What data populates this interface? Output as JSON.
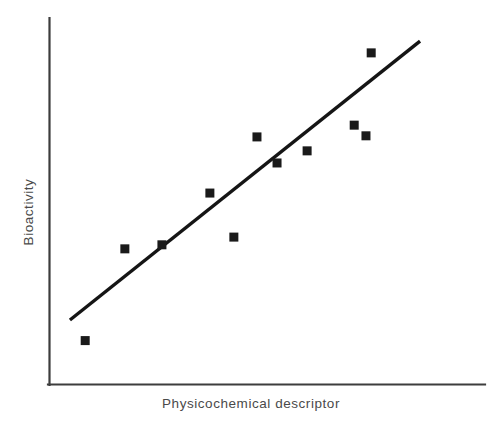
{
  "chart_data": {
    "type": "scatter",
    "title": "",
    "xlabel": "Physicochemical descriptor",
    "ylabel": "Bioactivity",
    "grid": false,
    "legend": false,
    "axis_ticks": false,
    "xlim": [
      0,
      100
    ],
    "ylim": [
      0,
      100
    ],
    "marker_style": "filled-square",
    "marker_color": "#1a1a1a",
    "axis_color": "#3d3d3d",
    "trend_line_color": "#151515",
    "background_color": "#ffffff",
    "points": [
      {
        "id": "p1",
        "x": 8.3,
        "y": 12.1
      },
      {
        "id": "p2",
        "x": 17.4,
        "y": 37.1
      },
      {
        "id": "p3",
        "x": 25.9,
        "y": 38.2
      },
      {
        "id": "p4",
        "x": 36.9,
        "y": 52.3
      },
      {
        "id": "p5",
        "x": 42.4,
        "y": 40.3
      },
      {
        "id": "p6",
        "x": 47.7,
        "y": 67.6
      },
      {
        "id": "p7",
        "x": 52.3,
        "y": 60.5
      },
      {
        "id": "p8",
        "x": 59.2,
        "y": 63.8
      },
      {
        "id": "p9",
        "x": 70.0,
        "y": 70.8
      },
      {
        "id": "p10",
        "x": 72.7,
        "y": 67.9
      },
      {
        "id": "p11",
        "x": 73.9,
        "y": 90.5
      }
    ],
    "trend_line": {
      "type": "linear-fit",
      "x_start": 4.8,
      "y_start": 17.7,
      "x_end": 85.1,
      "y_end": 93.7
    }
  },
  "figure": {
    "xlabel_text": "Physicochemical descriptor",
    "ylabel_text": "Bioactivity"
  }
}
